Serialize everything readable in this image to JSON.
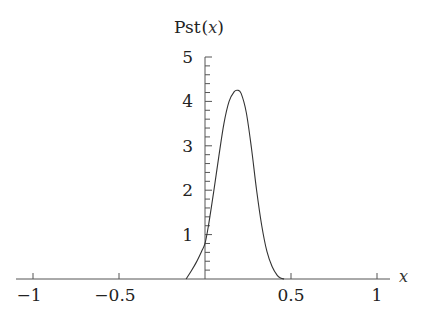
{
  "chart_data": {
    "type": "line",
    "title": "",
    "ylabel": "Pst(x)",
    "ylabel_main": "Pst",
    "ylabel_paren_open": "(",
    "ylabel_var": "x",
    "ylabel_paren_close": ")",
    "xlabel": "x",
    "xlim": [
      -1.07,
      1.05
    ],
    "ylim": [
      0,
      5
    ],
    "x_ticks": [
      -1,
      -0.5,
      0.5,
      1
    ],
    "x_tick_labels": [
      "−1",
      "−0.5",
      "0.5",
      "1"
    ],
    "y_ticks": [
      1,
      2,
      3,
      4,
      5
    ],
    "y_tick_labels": [
      "1",
      "2",
      "3",
      "4",
      "5"
    ],
    "y_minor_tick_step": 0.2,
    "grid": false,
    "legend": null,
    "series": [
      {
        "name": "Pst(x)",
        "color": "#333333",
        "x": [
          -0.11,
          -0.08,
          -0.05,
          -0.02,
          0.0,
          0.02,
          0.05,
          0.08,
          0.11,
          0.14,
          0.17,
          0.19,
          0.21,
          0.24,
          0.27,
          0.3,
          0.33,
          0.36,
          0.39,
          0.42,
          0.44,
          0.46
        ],
        "y": [
          0.0,
          0.18,
          0.38,
          0.62,
          0.8,
          1.2,
          1.95,
          2.75,
          3.5,
          4.0,
          4.22,
          4.25,
          4.18,
          3.75,
          2.95,
          2.0,
          1.2,
          0.62,
          0.28,
          0.08,
          0.02,
          0.0
        ]
      }
    ]
  }
}
